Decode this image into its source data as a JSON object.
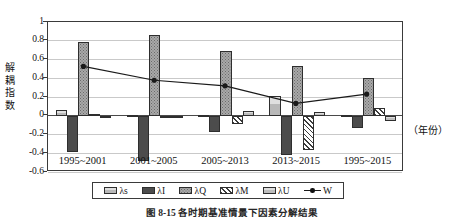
{
  "figure": {
    "caption": "图 8-15  各时期基准情景下因素分解结果",
    "x_axis_unit": "（年份）",
    "y_axis_title_chars": [
      "解",
      "耦",
      "指",
      "数"
    ]
  },
  "chart_data": {
    "type": "bar",
    "title": "",
    "xlabel": "（年份）",
    "ylabel": "解耦指数",
    "categories": [
      "1995~2001",
      "2001~2005",
      "2005~2013",
      "2013~2015",
      "1995~2015"
    ],
    "yticks": [
      "1",
      "0.8",
      "0.6",
      "0.4",
      "0.2",
      "0",
      "-0.2",
      "-0.4",
      "-0.6"
    ],
    "ytick_values": [
      1,
      0.8,
      0.6,
      0.4,
      0.2,
      0,
      -0.2,
      -0.4,
      -0.6
    ],
    "ylim": [
      -0.6,
      1
    ],
    "grid": true,
    "legend_position": "bottom",
    "series": [
      {
        "name": "λs",
        "key": "s",
        "fill": "light-gray-solid",
        "values": [
          0.06,
          0.01,
          0.01,
          0.21,
          0.01
        ]
      },
      {
        "name": "λI",
        "key": "i",
        "fill": "dark-gray-solid",
        "values": [
          -0.39,
          -0.48,
          -0.17,
          -0.42,
          -0.13
        ]
      },
      {
        "name": "λQ",
        "key": "q",
        "fill": "gray-dotted",
        "values": [
          0.79,
          0.86,
          0.69,
          0.53,
          0.4
        ]
      },
      {
        "name": "λM",
        "key": "m",
        "fill": "diagonal-hatch",
        "values": [
          0.02,
          -0.02,
          -0.09,
          -0.37,
          0.08
        ]
      },
      {
        "name": "λU",
        "key": "u",
        "fill": "light-gray-banded",
        "values": [
          0.0,
          -0.01,
          0.05,
          0.04,
          -0.06
        ]
      }
    ],
    "line_series": {
      "name": "W",
      "marker": "filled-circle",
      "values": [
        0.52,
        0.37,
        0.31,
        0.12,
        0.22
      ]
    }
  },
  "legend": {
    "items": [
      {
        "label": "λs",
        "type": "swatch",
        "fill": "light-gray-solid"
      },
      {
        "label": "λI",
        "type": "swatch",
        "fill": "dark-gray-solid"
      },
      {
        "label": "λQ",
        "type": "swatch",
        "fill": "gray-dotted"
      },
      {
        "label": "λM",
        "type": "swatch",
        "fill": "diagonal-hatch"
      },
      {
        "label": "λU",
        "type": "swatch",
        "fill": "light-gray-banded"
      },
      {
        "label": "W",
        "type": "line-marker"
      }
    ]
  },
  "colors": {
    "axis": "#3a3a3a",
    "grid": "#c9c9c9",
    "line": "#1a1a1a",
    "bar_light": "#b8b8b8",
    "bar_dark": "#4c4c4c",
    "bar_dotted": "#a9a9a9",
    "bar_hatch": "#3c3c3c",
    "bar_banded": "#bdbdbd"
  }
}
